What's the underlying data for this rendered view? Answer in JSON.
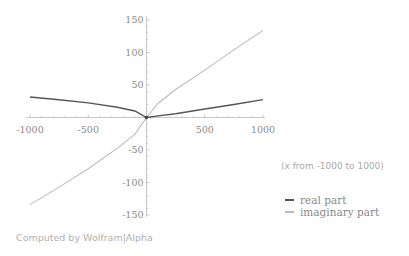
{
  "chart_data": {
    "type": "line",
    "title": "",
    "xlabel": "",
    "ylabel": "",
    "xlim": [
      -1000,
      1000
    ],
    "ylim": [
      -150,
      150
    ],
    "x_ticks": [
      -1000,
      -500,
      500,
      1000
    ],
    "y_ticks": [
      150,
      100,
      50,
      -50,
      -100,
      -150
    ],
    "x_tick_labels": [
      "-1000",
      "-500",
      "500",
      "1000"
    ],
    "y_tick_labels": [
      "150",
      "100",
      "50",
      "-50",
      "-100",
      "-150"
    ],
    "grid": false,
    "legend_position": "right",
    "x": [
      -1000,
      -750,
      -500,
      -250,
      -100,
      0,
      100,
      250,
      500,
      750,
      1000
    ],
    "series": [
      {
        "name": "real part",
        "color": "#555555",
        "values": [
          31.6,
          27.4,
          22.4,
          15.8,
          10,
          0,
          2.4,
          5.8,
          13,
          20,
          27.5
        ]
      },
      {
        "name": "imaginary part",
        "color": "#bbbbbb",
        "values": [
          -134,
          -107,
          -79,
          -47,
          -26,
          0,
          22,
          43,
          73,
          104,
          134
        ]
      }
    ],
    "annotations": [
      "(x from -1000 to 1000)"
    ]
  },
  "range_note": "(x from -1000 to 1000)",
  "legend": {
    "items": [
      {
        "label": "real part",
        "color": "#555555"
      },
      {
        "label": "imaginary part",
        "color": "#bbbbbb"
      }
    ]
  },
  "credit": "Computed by Wolfram|Alpha"
}
